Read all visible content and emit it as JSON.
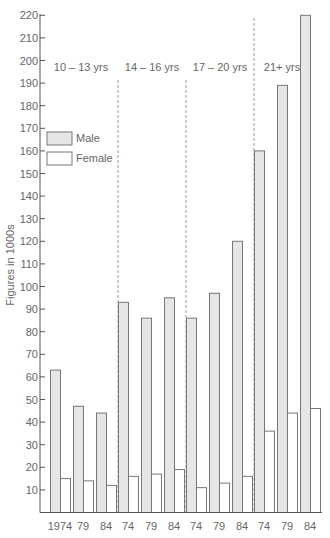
{
  "chart_data": {
    "type": "bar",
    "title": "",
    "xlabel": "",
    "ylabel": "Figures in 1000s",
    "ylim": [
      0,
      220
    ],
    "yticks": [
      10,
      20,
      30,
      40,
      50,
      60,
      70,
      80,
      90,
      100,
      110,
      120,
      130,
      140,
      150,
      160,
      170,
      180,
      190,
      200,
      210,
      220
    ],
    "grid": false,
    "legend_position": "upper-left",
    "groups": [
      {
        "label": "10 – 13 yrs",
        "years": [
          "1974",
          "79",
          "84"
        ]
      },
      {
        "label": "14 – 16 yrs",
        "years": [
          "74",
          "79",
          "84"
        ]
      },
      {
        "label": "17 – 20 yrs",
        "years": [
          "74",
          "79",
          "84"
        ]
      },
      {
        "label": "21+ yrs",
        "years": [
          "74",
          "79",
          "84"
        ]
      }
    ],
    "categories": [
      "1974",
      "79",
      "84",
      "74",
      "79",
      "84",
      "74",
      "79",
      "84",
      "74",
      "79",
      "84"
    ],
    "series": [
      {
        "name": "Male",
        "color": "#e6e6e6",
        "values": [
          63,
          47,
          44,
          93,
          86,
          95,
          86,
          97,
          120,
          160,
          189,
          220
        ]
      },
      {
        "name": "Female",
        "color": "#ffffff",
        "values": [
          15,
          14,
          12,
          16,
          17,
          19,
          11,
          13,
          16,
          36,
          44,
          46
        ]
      }
    ]
  },
  "colors": {
    "axis": "#555555",
    "male_fill": "#e6e6e6",
    "female_fill": "#ffffff",
    "bar_stroke": "#777777",
    "divider": "#999999"
  }
}
